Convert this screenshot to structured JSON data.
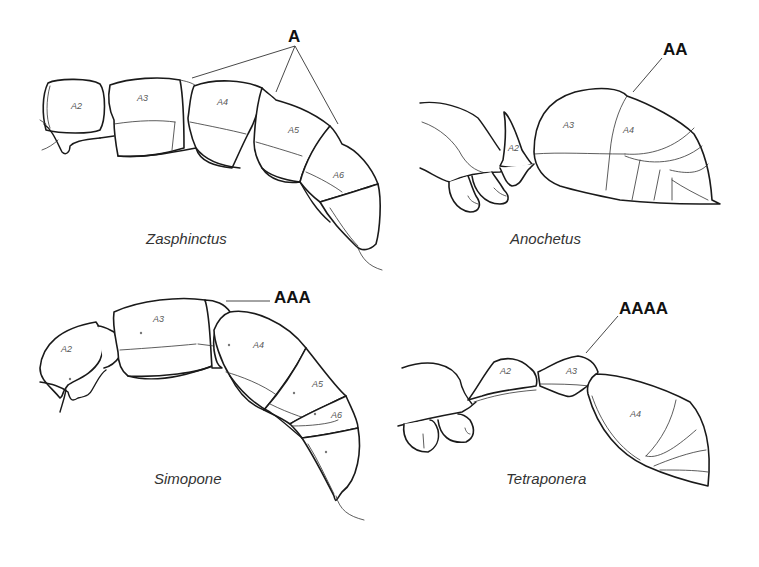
{
  "figure": {
    "panels": [
      {
        "genus": "Zasphinctus",
        "annotation": "A",
        "segments": [
          "A2",
          "A3",
          "A4",
          "A5",
          "A6"
        ]
      },
      {
        "genus": "Anochetus",
        "annotation": "AA",
        "segments": [
          "A2",
          "A3",
          "A4"
        ]
      },
      {
        "genus": "Simopone",
        "annotation": "AAA",
        "segments": [
          "A2",
          "A3",
          "A4",
          "A5",
          "A6"
        ]
      },
      {
        "genus": "Tetraponera",
        "annotation": "AAAA",
        "segments": [
          "A2",
          "A3",
          "A4"
        ]
      }
    ],
    "colors": {
      "line": "#1a1a1a",
      "label": "#555555",
      "background": "#ffffff"
    }
  }
}
